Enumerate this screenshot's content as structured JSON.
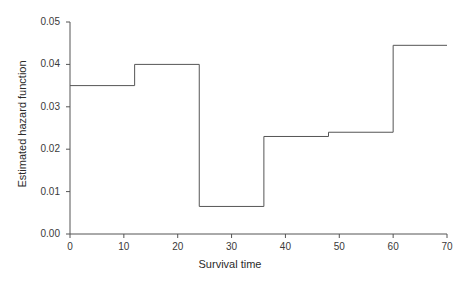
{
  "chart_data": {
    "type": "line",
    "subtype": "step",
    "title": "",
    "xlabel": "Survival time",
    "ylabel": "Estimated hazard function",
    "xlim": [
      0,
      70
    ],
    "ylim": [
      0,
      0.05
    ],
    "grid": false,
    "legend": null,
    "x_ticks": [
      "0",
      "10",
      "20",
      "30",
      "40",
      "50",
      "60",
      "70"
    ],
    "x_tick_values": [
      0,
      10,
      20,
      30,
      40,
      50,
      60,
      70
    ],
    "y_ticks": [
      "0.00",
      "0.01",
      "0.02",
      "0.03",
      "0.04",
      "0.05"
    ],
    "y_tick_values": [
      0,
      0.01,
      0.02,
      0.03,
      0.04,
      0.05
    ],
    "series": [
      {
        "name": "Estimated hazard function",
        "color": "#555555",
        "intervals": [
          {
            "x_start": 0,
            "x_end": 12,
            "value": 0.035
          },
          {
            "x_start": 12,
            "x_end": 24,
            "value": 0.04
          },
          {
            "x_start": 24,
            "x_end": 36,
            "value": 0.0065
          },
          {
            "x_start": 36,
            "x_end": 48,
            "value": 0.023
          },
          {
            "x_start": 48,
            "x_end": 60,
            "value": 0.024
          },
          {
            "x_start": 60,
            "x_end": 70,
            "value": 0.0445
          }
        ]
      }
    ]
  },
  "axis": {
    "line_color": "#555555"
  }
}
